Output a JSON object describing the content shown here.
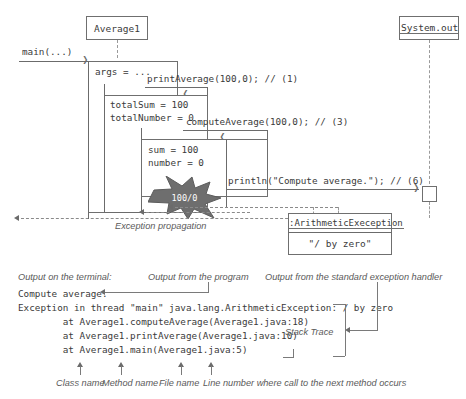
{
  "diagram": {
    "type": "uml-sequence-diagram",
    "title_partial": "",
    "participants": [
      {
        "name": "Average1",
        "underlined": false
      },
      {
        "name": "System.out",
        "underlined": true
      }
    ],
    "entry_message": "main(...)",
    "activations": [
      {
        "id": "main",
        "locals": [
          "args = ..."
        ]
      },
      {
        "id": "print",
        "locals": [
          "totalSum = 100",
          "totalNumber = 0"
        ]
      },
      {
        "id": "compute",
        "locals": [
          "sum = 100",
          "number = 0"
        ]
      }
    ],
    "messages": [
      {
        "label": "printAverage(100,0); // (1)"
      },
      {
        "label": "computeAverage(100,0); // (3)"
      },
      {
        "label": "println(\"Compute average.\"); // (6)"
      }
    ],
    "exception_star": "100/0",
    "exception_propagation_label": "Exception propagation",
    "exception_object": {
      "name": ":ArithmeticExeception",
      "message": "\"/ by zero\""
    }
  },
  "terminal": {
    "caption_left": "Output on the terminal:",
    "caption_program": "Output from the program",
    "caption_handler": "Output from the standard exception handler",
    "lines": [
      "Compute average.",
      "Exception in thread \"main\" java.lang.ArithmeticException: / by zero",
      "        at Average1.computeAverage(Average1.java:18)",
      "        at Average1.printAverage(Average1.java:10)",
      "        at Average1.main(Average1.java:5)"
    ],
    "stack_trace_label": "Stack Trace"
  },
  "legend": {
    "items": [
      "Class name",
      "Method name",
      "File name",
      "Line number where call to the next method occurs"
    ]
  },
  "colors": {
    "line": "#6b6b6b",
    "text": "#3a3a3a",
    "anno": "#5a5a5a",
    "star_fill": "#6e6e6e",
    "dash": "#9a9a9a"
  }
}
